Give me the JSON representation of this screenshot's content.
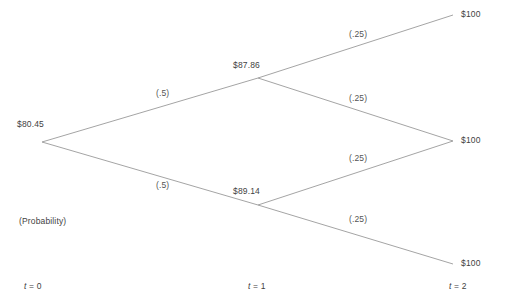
{
  "diagram": {
    "type": "binomial-tree",
    "caption": "(Probability)",
    "line_color": "#9a9a9a",
    "text_color": "#4a4a4a"
  },
  "nodes": {
    "root": {
      "label": "$80.45",
      "x": 42,
      "y": 142
    },
    "up1": {
      "label": "$87.86",
      "x": 258,
      "y": 78
    },
    "down1": {
      "label": "$89.14",
      "x": 258,
      "y": 205
    },
    "uu": {
      "label": "$100",
      "x": 453,
      "y": 15
    },
    "ud": {
      "label": "$100",
      "x": 453,
      "y": 141
    },
    "dd": {
      "label": "$100",
      "x": 453,
      "y": 264
    }
  },
  "probabilities": {
    "root_up": "(.5)",
    "root_down": "(.5)",
    "up_up": "(.25)",
    "up_down": "(.25)",
    "down_up": "(.25)",
    "down_down": "(.25)"
  },
  "axis": {
    "t0": {
      "t": "t",
      "eq": " = 0"
    },
    "t1": {
      "t": "t",
      "eq": " = 1"
    },
    "t2": {
      "t": "t",
      "eq": " = 2"
    }
  }
}
